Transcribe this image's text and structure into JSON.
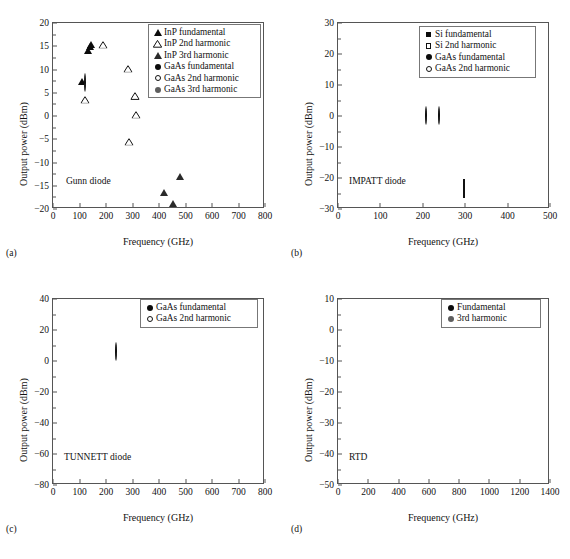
{
  "figure": {
    "panels": [
      {
        "tag": "(a)",
        "note": "Gunn diode",
        "xlabel": "Frequency (GHz)",
        "ylabel": "Output power (dBm)",
        "legend": [
          {
            "marker": "tri-f",
            "label": "InP fundamental"
          },
          {
            "marker": "tri-o",
            "label": "InP 2nd harmonic"
          },
          {
            "marker": "tri-g",
            "label": "InP 3rd harmonic"
          },
          {
            "marker": "circle-f",
            "label": "GaAs fundamental"
          },
          {
            "marker": "circle-o",
            "label": "GaAs 2nd harmonic"
          },
          {
            "marker": "circle-g",
            "label": "GaAs 3rd harmonic"
          }
        ],
        "chart_data": {
          "type": "scatter",
          "title": "Gunn diode",
          "xlabel": "Frequency (GHz)",
          "ylabel": "Output power (dBm)",
          "xlim": [
            0,
            800
          ],
          "ylim": [
            -20,
            20
          ],
          "xticks": [
            0,
            100,
            200,
            300,
            400,
            500,
            600,
            700,
            800
          ],
          "yticks": [
            -20,
            -15,
            -10,
            -5,
            0,
            5,
            10,
            15,
            20
          ],
          "grid": false,
          "legend_position": "top-right",
          "series": [
            {
              "name": "InP fundamental",
              "marker": "tri-f",
              "points": [
                [
                  138,
                  17.5
                ],
                [
                  143,
                  17.9
                ],
                [
                  133,
                  16.5
                ],
                [
                  110,
                  10.0
                ]
              ]
            },
            {
              "name": "InP 2nd harmonic",
              "marker": "tri-o",
              "points": [
                [
                  190,
                  15.3
                ],
                [
                  283,
                  10.2
                ],
                [
                  310,
                  4.3
                ],
                [
                  313,
                  0.3
                ],
                [
                  285,
                  -5.5
                ],
                [
                  122,
                  3.5
                ]
              ]
            },
            {
              "name": "InP 3rd harmonic",
              "marker": "tri-g",
              "points": [
                [
                  478,
                  -10.6
                ],
                [
                  420,
                  -13.9
                ],
                [
                  453,
                  -16.3
                ]
              ]
            },
            {
              "name": "GaAs fundamental",
              "marker": "circle-f",
              "points": [
                [
                  113,
                  6.2
                ]
              ]
            },
            {
              "name": "GaAs 2nd harmonic",
              "marker": "circle-o",
              "points": [
                [
                  120,
                  7.0
                ]
              ]
            },
            {
              "name": "GaAs 3rd harmonic",
              "marker": "circle-g",
              "points": [
                [
                  125,
                  4.9
                ]
              ]
            }
          ]
        }
      },
      {
        "tag": "(b)",
        "note": "IMPATT diode",
        "xlabel": "Frequency (GHz)",
        "ylabel": "Output power (dBm)",
        "legend": [
          {
            "marker": "square-f",
            "label": "Si fundamental"
          },
          {
            "marker": "square-o",
            "label": "Si 2nd harmonic"
          },
          {
            "marker": "circle-f",
            "label": "GaAs fundamental"
          },
          {
            "marker": "circle-o",
            "label": "GaAs 2nd harmonic"
          }
        ],
        "chart_data": {
          "type": "scatter",
          "title": "IMPATT diode",
          "xlabel": "Frequency (GHz)",
          "ylabel": "Output power (dBm)",
          "xlim": [
            0,
            500
          ],
          "ylim": [
            -30,
            30
          ],
          "xticks": [
            0,
            100,
            200,
            300,
            400,
            500
          ],
          "yticks": [
            -30,
            -20,
            -10,
            0,
            10,
            20,
            30
          ],
          "grid": false,
          "legend_position": "top-right",
          "series": [
            {
              "name": "Si fundamental",
              "marker": "square-f",
              "points": [
                [
                  97,
                  14.9
                ],
                [
                  110,
                  18.7
                ],
                [
                  137,
                  24.9
                ],
                [
                  140,
                  18.6
                ],
                [
                  148,
                  18.8
                ],
                [
                  152,
                  16.7
                ],
                [
                  160,
                  19.4
                ],
                [
                  166,
                  14.6
                ],
                [
                  209,
                  13.9
                ],
                [
                  245,
                  2.8
                ],
                [
                  299,
                  0.8
                ],
                [
                  358,
                  -7.0
                ]
              ]
            },
            {
              "name": "Si 2nd harmonic",
              "marker": "square-o",
              "points": [
                [
                  297,
                  -23.4
                ]
              ]
            },
            {
              "name": "GaAs fundamental",
              "marker": "circle-f",
              "points": [
                [
                  129,
                  7.0
                ],
                [
                  143,
                  20.2
                ]
              ]
            },
            {
              "name": "GaAs 2nd harmonic",
              "marker": "circle-o",
              "points": [
                [
                  208,
                  0.1
                ],
                [
                  239,
                  0.1
                ]
              ]
            }
          ]
        }
      },
      {
        "tag": "(c)",
        "note": "TUNNETT diode",
        "xlabel": "Frequency (GHz)",
        "ylabel": "Output power (dBm)",
        "legend": [
          {
            "marker": "circle-f",
            "label": "GaAs fundamental"
          },
          {
            "marker": "circle-o",
            "label": "GaAs 2nd harmonic"
          }
        ],
        "chart_data": {
          "type": "scatter",
          "title": "TUNNETT diode",
          "xlabel": "Frequency (GHz)",
          "ylabel": "Output power (dBm)",
          "xlim": [
            0,
            800
          ],
          "ylim": [
            -80,
            40
          ],
          "xticks": [
            0,
            100,
            200,
            300,
            400,
            500,
            600,
            700,
            800
          ],
          "yticks": [
            -80,
            -60,
            -40,
            -20,
            0,
            20,
            40
          ],
          "grid": false,
          "legend_position": "top-right",
          "series": [
            {
              "name": "GaAs fundamental",
              "marker": "circle-f",
              "points": [
                [
                  102,
                  21.5
                ],
                [
                  103,
                  20.0
                ],
                [
                  104,
                  18.6
                ],
                [
                  106,
                  19.5
                ],
                [
                  182,
                  -21.3
                ],
                [
                  238,
                  -48.8
                ],
                [
                  320,
                  -13.0
                ],
                [
                  350,
                  -8.7
                ],
                [
                  393,
                  -42.3
                ],
                [
                  652,
                  -60.8
                ],
                [
                  703,
                  -66.5
                ]
              ]
            },
            {
              "name": "GaAs 2nd harmonic",
              "marker": "circle-o",
              "points": [
                [
                  236,
                  6.0
                ]
              ]
            }
          ]
        }
      },
      {
        "tag": "(d)",
        "note": "RTD",
        "xlabel": "Frequency (GHz)",
        "ylabel": "Output power (dBm)",
        "legend": [
          {
            "marker": "circle-f",
            "label": "Fundamental"
          },
          {
            "marker": "circle-g",
            "label": "3rd harmonic"
          }
        ],
        "chart_data": {
          "type": "scatter",
          "title": "RTD",
          "xlabel": "Frequency (GHz)",
          "ylabel": "Output power (dBm)",
          "xlim": [
            0,
            1400
          ],
          "ylim": [
            -50,
            10
          ],
          "xticks": [
            0,
            200,
            400,
            600,
            800,
            1000,
            1200,
            1400
          ],
          "yticks": [
            -50,
            -40,
            -30,
            -20,
            -10,
            0,
            10
          ],
          "grid": false,
          "legend_position": "top-right",
          "series": [
            {
              "name": "Fundamental",
              "marker": "circle-f",
              "points": [
                [
                  203,
                  -13.0
                ],
                [
                  272,
                  -8.4
                ],
                [
                  283,
                  -19.0
                ],
                [
                  313,
                  -22.9
                ],
                [
                  443,
                  -7.0
                ],
                [
                  449,
                  -32.2
                ],
                [
                  543,
                  -3.6
                ],
                [
                  597,
                  -21.0
                ],
                [
                  806,
                  -7.4
                ],
                [
                  825,
                  -30.0
                ],
                [
                  1022,
                  -21.5
                ],
                [
                  1063,
                  -22.8
                ],
                [
                  1105,
                  -40.2
                ]
              ]
            },
            {
              "name": "3rd harmonic",
              "marker": "circle-g",
              "points": [
                [
                  1028,
                  -32.1
                ]
              ]
            }
          ]
        }
      }
    ]
  }
}
